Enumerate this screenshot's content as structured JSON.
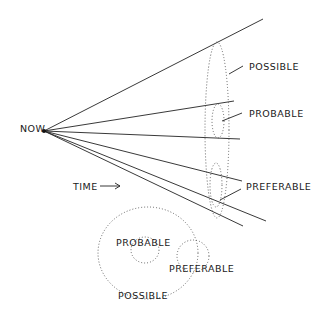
{
  "diagram": {
    "origin_label": "NOW",
    "time_label": "TIME",
    "time_arrow": "→",
    "cone_labels": {
      "possible": "POSSIBLE",
      "probable": "PROBABLE",
      "preferable": "PREFERABLE"
    },
    "venn_labels": {
      "probable": "PROBABLE",
      "preferable": "PREFERABLE",
      "possible": "POSSIBLE"
    },
    "colors": {
      "line": "#222222",
      "dotted": "#555555",
      "background": "#ffffff"
    }
  }
}
